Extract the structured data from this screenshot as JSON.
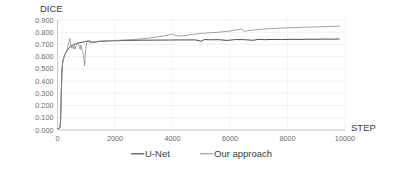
{
  "chart_data": {
    "type": "line",
    "title": "",
    "xlabel": "STEP",
    "ylabel": "DICE",
    "xlim": [
      0,
      10000
    ],
    "ylim": [
      0,
      0.9
    ],
    "grid": true,
    "legend_position": "bottom",
    "x_ticks": [
      "0",
      "2000",
      "4000",
      "6000",
      "8000",
      "10000"
    ],
    "x_tick_values": [
      0,
      2000,
      4000,
      6000,
      8000,
      10000
    ],
    "y_ticks": [
      "0.000",
      "0.100",
      "0.200",
      "0.300",
      "0.400",
      "0.500",
      "0.600",
      "0.700",
      "0.800",
      "0.900"
    ],
    "y_tick_values": [
      0.0,
      0.1,
      0.2,
      0.3,
      0.4,
      0.5,
      0.6,
      0.7,
      0.8,
      0.9
    ],
    "series": [
      {
        "name": "U-Net",
        "color": "#4d4d4d",
        "x": [
          0,
          40,
          70,
          90,
          110,
          130,
          150,
          175,
          200,
          230,
          260,
          300,
          340,
          380,
          430,
          480,
          530,
          580,
          640,
          700,
          760,
          820,
          880,
          940,
          1000,
          1060,
          1120,
          1200,
          1300,
          1400,
          1500,
          1700,
          1900,
          2100,
          2400,
          2700,
          3000,
          3300,
          3600,
          3900,
          4200,
          4500,
          4800,
          5000,
          5100,
          5300,
          5600,
          5900,
          6200,
          6500,
          6800,
          7000,
          7200,
          7500,
          7800,
          8100,
          8400,
          8700,
          9000,
          9300,
          9600,
          9800
        ],
        "y": [
          0.012,
          0.014,
          0.016,
          0.02,
          0.11,
          0.3,
          0.46,
          0.545,
          0.578,
          0.6,
          0.618,
          0.638,
          0.652,
          0.665,
          0.678,
          0.688,
          0.695,
          0.7,
          0.705,
          0.71,
          0.713,
          0.716,
          0.719,
          0.722,
          0.724,
          0.727,
          0.729,
          0.715,
          0.718,
          0.722,
          0.725,
          0.728,
          0.73,
          0.731,
          0.733,
          0.734,
          0.735,
          0.735,
          0.736,
          0.736,
          0.737,
          0.737,
          0.737,
          0.726,
          0.74,
          0.738,
          0.739,
          0.733,
          0.74,
          0.739,
          0.734,
          0.742,
          0.739,
          0.741,
          0.74,
          0.742,
          0.741,
          0.743,
          0.742,
          0.744,
          0.743,
          0.745
        ]
      },
      {
        "name": "Our approach",
        "color": "#8c8c8c",
        "x": [
          0,
          40,
          70,
          90,
          110,
          130,
          150,
          175,
          200,
          230,
          260,
          300,
          340,
          370,
          400,
          430,
          460,
          490,
          520,
          550,
          580,
          610,
          640,
          670,
          700,
          730,
          760,
          790,
          820,
          850,
          880,
          910,
          940,
          960,
          980,
          1000,
          1030,
          1060,
          1090,
          1120,
          1200,
          1300,
          1400,
          1600,
          1800,
          2000,
          2300,
          2600,
          2900,
          3200,
          3500,
          3800,
          4000,
          4100,
          4300,
          4500,
          4700,
          5000,
          5300,
          5600,
          5900,
          6200,
          6400,
          6500,
          6600,
          6800,
          7100,
          7400,
          7700,
          8000,
          8300,
          8600,
          8900,
          9200,
          9500,
          9800
        ],
        "y": [
          0.01,
          0.012,
          0.014,
          0.018,
          0.09,
          0.28,
          0.45,
          0.54,
          0.575,
          0.598,
          0.615,
          0.638,
          0.66,
          0.69,
          0.72,
          0.748,
          0.7,
          0.67,
          0.69,
          0.665,
          0.69,
          0.66,
          0.682,
          0.7,
          0.715,
          0.7,
          0.68,
          0.66,
          0.695,
          0.66,
          0.64,
          0.61,
          0.525,
          0.6,
          0.665,
          0.7,
          0.728,
          0.735,
          0.72,
          0.712,
          0.718,
          0.722,
          0.726,
          0.73,
          0.732,
          0.733,
          0.736,
          0.74,
          0.745,
          0.752,
          0.762,
          0.775,
          0.785,
          0.772,
          0.768,
          0.775,
          0.782,
          0.79,
          0.795,
          0.8,
          0.807,
          0.818,
          0.826,
          0.806,
          0.812,
          0.818,
          0.824,
          0.829,
          0.833,
          0.836,
          0.838,
          0.841,
          0.843,
          0.845,
          0.847,
          0.849
        ]
      }
    ]
  },
  "legend": {
    "items": [
      {
        "label": "U-Net"
      },
      {
        "label": "Our approach"
      }
    ]
  }
}
